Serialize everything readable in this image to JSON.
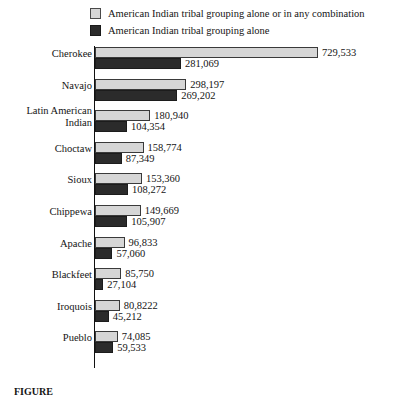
{
  "legend": {
    "position": "top",
    "items": [
      {
        "label": "American Indian tribal grouping alone or in any combination",
        "swatch": "light-gray-swatch-icon",
        "color": "#d6d6d6"
      },
      {
        "label": "American Indian tribal grouping alone",
        "swatch": "dark-swatch-icon",
        "color": "#2b2b2b"
      }
    ]
  },
  "caption": {
    "figure_label": "FIGURE",
    "text": ""
  },
  "chart_data": {
    "type": "bar",
    "orientation": "horizontal",
    "title": "",
    "subtitle": "",
    "xlabel": "",
    "ylabel": "",
    "grid": false,
    "legend_position": "top",
    "xlim": [
      0,
      729533
    ],
    "categories": [
      "Cherokee",
      "Navajo",
      "Latin American Indian",
      "Choctaw",
      "Sioux",
      "Chippewa",
      "Apache",
      "Blackfeet",
      "Iroquois",
      "Pueblo"
    ],
    "series": [
      {
        "name": "American Indian tribal grouping alone or in any combination",
        "color": "#d6d6d6",
        "values": [
          729533,
          298197,
          180940,
          158774,
          153360,
          149669,
          96833,
          85750,
          80822,
          74085
        ],
        "labels": [
          "729,533",
          "298,197",
          "180,940",
          "158,774",
          "153,360",
          "149,669",
          "96,833",
          "85,750",
          "80,8222",
          "74,085"
        ]
      },
      {
        "name": "American Indian tribal grouping alone",
        "color": "#2b2b2b",
        "values": [
          281069,
          269202,
          104354,
          87349,
          108272,
          105907,
          57060,
          27104,
          45212,
          59533
        ],
        "labels": [
          "281,069",
          "269,202",
          "104,354",
          "87,349",
          "108,272",
          "105,907",
          "57,060",
          "27,104",
          "45,212",
          "59,533"
        ]
      }
    ]
  },
  "rows": [
    {
      "label": "Cherokee",
      "two_line": false,
      "line1": "Cherokee",
      "line2": ""
    },
    {
      "label": "Navajo",
      "two_line": false,
      "line1": "Navajo",
      "line2": ""
    },
    {
      "label": "Latin American Indian",
      "two_line": true,
      "line1": "Latin American",
      "line2": "Indian"
    },
    {
      "label": "Choctaw",
      "two_line": false,
      "line1": "Choctaw",
      "line2": ""
    },
    {
      "label": "Sioux",
      "two_line": false,
      "line1": "Sioux",
      "line2": ""
    },
    {
      "label": "Chippewa",
      "two_line": false,
      "line1": "Chippewa",
      "line2": ""
    },
    {
      "label": "Apache",
      "two_line": false,
      "line1": "Apache",
      "line2": ""
    },
    {
      "label": "Blackfeet",
      "two_line": false,
      "line1": "Blackfeet",
      "line2": ""
    },
    {
      "label": "Iroquois",
      "two_line": false,
      "line1": "Iroquois",
      "line2": ""
    },
    {
      "label": "Pueblo",
      "two_line": false,
      "line1": "Pueblo",
      "line2": ""
    }
  ]
}
